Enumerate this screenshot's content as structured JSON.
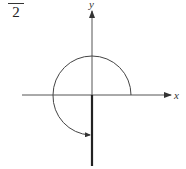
{
  "label": {
    "denominator": "2"
  },
  "diagram": {
    "type": "angle-in-standard-position",
    "x_axis_label": "x",
    "y_axis_label": "y",
    "angle_description": "counterclockwise rotation of 3/4 turn, terminal side on negative y-axis",
    "colors": {
      "stroke": "#333333"
    }
  }
}
